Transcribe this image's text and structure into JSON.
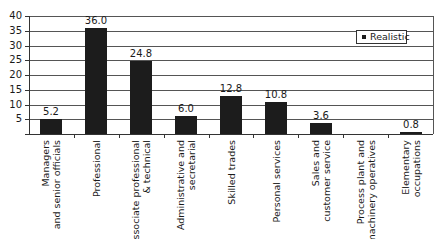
{
  "chart_data": {
    "type": "bar",
    "title": "",
    "xlabel": "",
    "ylabel": "",
    "ylim": [
      0,
      40
    ],
    "yticks": [
      5,
      10,
      15,
      20,
      25,
      30,
      35,
      40
    ],
    "grid": true,
    "legend_position": "upper right",
    "categories": [
      "Managers\nand senior officials",
      "Professional",
      "Associate professional\n& technical",
      "Administrative and\nsecretarial",
      "Skilled trades",
      "Personal services",
      "Sales and\ncustomer service",
      "Process plant and\nmachinery operatives",
      "Elementary\noccupations"
    ],
    "series": [
      {
        "name": "Realistic",
        "color": "#1c1c1c",
        "values": [
          5.2,
          36.0,
          24.8,
          6.0,
          12.8,
          10.8,
          3.6,
          0,
          0.8
        ],
        "labels": [
          "5.2",
          "36.0",
          "24.8",
          "6.0",
          "12.8",
          "10.8",
          "3.6",
          "",
          "0.8"
        ]
      }
    ]
  },
  "legend": {
    "label": "Realistic"
  }
}
